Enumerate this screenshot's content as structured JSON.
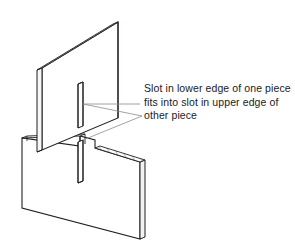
{
  "figure": {
    "type": "isometric-line-drawing",
    "background_color": "#ffffff",
    "line_color": "#231f20",
    "leader_line_color": "#8c8c8c",
    "hatch_color": "#231f20"
  },
  "annotation": {
    "text": "Slot in lower edge of one piece fits into slot in upper edge of other piece",
    "line1": "Slot in lower edge of one",
    "line2": "piece fits into slot in upper",
    "line3": "edge of other piece",
    "text_color": "#1a1a1a"
  },
  "parts": {
    "upper_piece": {
      "label": "upper vertical panel",
      "slot": "slot in lower edge"
    },
    "lower_piece": {
      "label": "lower horizontal-set panel",
      "slot": "slot in upper edge"
    }
  },
  "leaders": {
    "count": 2,
    "target_upper_slot": "top of slot in upper piece",
    "target_lower_slot": "top of slot in lower piece"
  }
}
